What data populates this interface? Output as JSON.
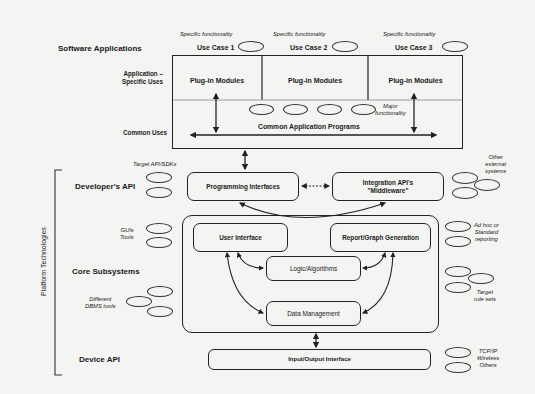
{
  "left_labels": {
    "software_applications": "Software Applications",
    "application_specific_uses": "Application –\nSpecific Uses",
    "common_uses": "Common Uses",
    "developers_api": "Developer's API",
    "core_subsystems": "Core Subsystems",
    "device_api": "Device API",
    "platform_technologies": "Platform Technologies"
  },
  "use_cases": [
    {
      "annotation": "Specific functionality",
      "label": "Use Case 1",
      "module": "Plug-in Modules"
    },
    {
      "annotation": "Specific functionality",
      "label": "Use Case 2",
      "module": "Plug-in Modules"
    },
    {
      "annotation": "Specific functionality",
      "label": "Use Case 3",
      "module": "Plug-in Modules"
    }
  ],
  "common_application_programs": {
    "label": "Common Application Programs",
    "annotation": "Major\nfunctionality"
  },
  "developer_api": {
    "programming_interfaces": "Programming Interfaces",
    "integration_apis": "Integration API's\n\"Middleware\"",
    "left_annotation": "Target API/SDKs",
    "right_annotation": "Other\nexternal\nsystems"
  },
  "core": {
    "user_interface": "User Interface",
    "report_graph_generation": "Report/Graph Generation",
    "logic_algorithms": "Logic/Algorithms",
    "data_management": "Data Management",
    "left_annotations": {
      "guis_tools": "GUIs\nTools",
      "dbms_tools": "Different\nDBMS tools"
    },
    "right_annotations": {
      "reporting": "Ad hoc or\nStandard\nreporting",
      "rule_sets": "Target\nrule sets"
    }
  },
  "device": {
    "io_interface": "Input/Output Interface",
    "annotation": "TCP/IP\nWireless\nOthers"
  },
  "colors": {
    "background": "#f4f4f2",
    "stroke": "#222222"
  }
}
